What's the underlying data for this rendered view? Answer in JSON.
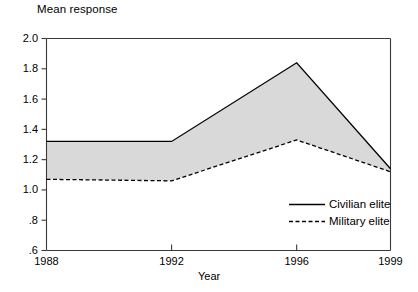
{
  "chart_data": {
    "type": "line",
    "title": "",
    "xlabel": "Year",
    "ylabel": "Mean response",
    "x": [
      1988,
      1992,
      1996,
      1999
    ],
    "xticklabels": [
      "1988",
      "1992",
      "1996",
      "1999"
    ],
    "yticks": [
      0.6,
      0.8,
      1.0,
      1.2,
      1.4,
      1.6,
      1.8,
      2.0
    ],
    "yticklabels": [
      ".6",
      ".8",
      "1.0",
      "1.2",
      "1.4",
      "1.6",
      "1.8",
      "2.0"
    ],
    "ylim": [
      0.6,
      2.0
    ],
    "xlim": [
      1988,
      1999
    ],
    "grid": false,
    "legend_position": "lower-right-inside",
    "fill_between_color": "#d9d9d9",
    "series": [
      {
        "name": "Civilian elite",
        "style": "solid",
        "color": "#000000",
        "values": [
          1.32,
          1.32,
          1.84,
          1.14
        ]
      },
      {
        "name": "Military elite",
        "style": "dashed",
        "color": "#000000",
        "values": [
          1.07,
          1.06,
          1.33,
          1.12
        ]
      }
    ]
  },
  "legend": {
    "civilian_label": "Civilian elite",
    "military_label": "Military elite"
  },
  "axis": {
    "y_title": "Mean response",
    "x_title": "Year"
  }
}
